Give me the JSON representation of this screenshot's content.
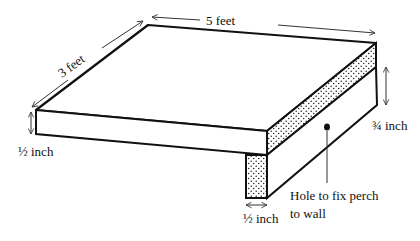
{
  "diagram": {
    "labels": {
      "length": "5 feet",
      "depth": "3 feet",
      "front_thickness": "½ inch",
      "side_thickness": "¾ inch",
      "leg_width": "½ inch",
      "hole_line1": "Hole to fix perch",
      "hole_line2": "to wall"
    },
    "colors": {
      "stroke": "#111111",
      "background": "#ffffff",
      "stipple": "#222222"
    }
  }
}
